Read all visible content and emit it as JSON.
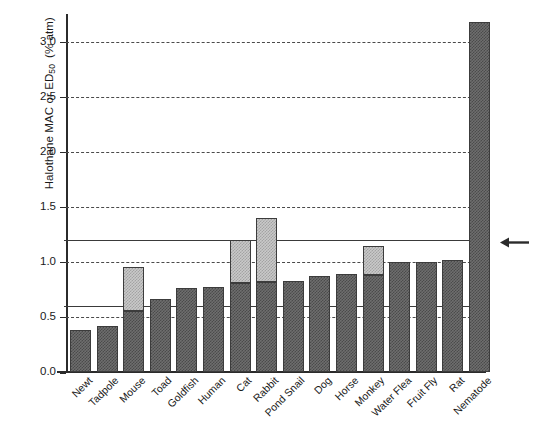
{
  "chart_data": {
    "type": "bar",
    "title": "",
    "subtitle": "",
    "xlabel": "",
    "ylabel": "Halothane MAC or ED50  (% atm)",
    "ylabel_parts": {
      "main": "Halothane MAC or ED",
      "sub": "50",
      "unit": "(% atm)"
    },
    "ylim": [
      0.0,
      3.25
    ],
    "ytick_labels": [
      "0.0",
      "0.5",
      "1.0",
      "1.5",
      "2.0",
      "2.5",
      "3.0"
    ],
    "ytick_values": [
      0.0,
      0.5,
      1.0,
      1.5,
      2.0,
      2.5,
      3.0
    ],
    "grid": "horizontal-dashed",
    "legend": "none",
    "categories": [
      "Newt",
      "Tadpole",
      "Mouse",
      "Toad",
      "Goldfish",
      "Human",
      "Cat",
      "Rabbit",
      "Pond Snail",
      "Dog",
      "Horse",
      "Monkey",
      "Water Flea",
      "Fruit Fly",
      "Rat",
      "Nematode"
    ],
    "series": [
      {
        "name": "Lower estimate (dark)",
        "values": [
          0.38,
          0.42,
          0.55,
          0.66,
          0.76,
          0.77,
          0.81,
          0.82,
          0.83,
          0.87,
          0.89,
          0.88,
          1.0,
          1.0,
          1.02,
          3.18
        ]
      },
      {
        "name": "Upper estimate (light)",
        "values": [
          0.38,
          0.42,
          0.95,
          0.66,
          0.76,
          0.77,
          1.2,
          1.4,
          0.83,
          0.87,
          0.89,
          1.14,
          1.0,
          1.0,
          1.02,
          3.18
        ]
      }
    ],
    "reference_lines": [
      {
        "name": "upper-reference-line",
        "value": 1.2,
        "style": "solid"
      },
      {
        "name": "lower-reference-line",
        "value": 0.6,
        "style": "solid"
      }
    ],
    "annotations": [
      {
        "name": "human-mac-arrow",
        "glyph": "←",
        "value": 1.17,
        "position": "right-outside"
      }
    ],
    "colors": {
      "dark_fill": "#6e6e6e",
      "dark_hatch": "#4b4b4b",
      "light_fill": "#c9c9c9",
      "light_hatch": "#a3a3a3",
      "bar_edge": "#3c3c3c",
      "axis": "#2b2b2b",
      "grid": "#4a4a4a",
      "reference": "#3a3a3a",
      "background": "#ffffff"
    }
  }
}
